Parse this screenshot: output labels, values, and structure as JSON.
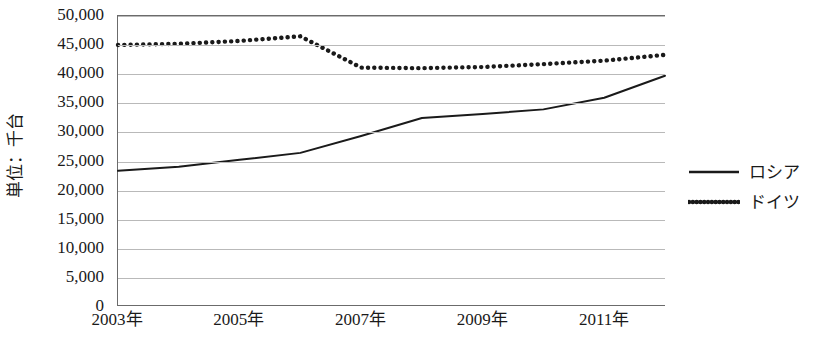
{
  "chart_data": {
    "type": "line",
    "title": "",
    "subtitle": "",
    "xlabel": "",
    "ylabel": "単位：千台",
    "x": [
      2003,
      2004,
      2005,
      2006,
      2007,
      2008,
      2009,
      2010,
      2011,
      2012
    ],
    "x_tick_labels": [
      "2003年",
      "2005年",
      "2007年",
      "2009年",
      "2011年"
    ],
    "x_tick_values": [
      2003,
      2005,
      2007,
      2009,
      2011
    ],
    "xlim": [
      2003,
      2012
    ],
    "ylim": [
      0,
      50000
    ],
    "y_ticks": [
      0,
      5000,
      10000,
      15000,
      20000,
      25000,
      30000,
      35000,
      40000,
      45000,
      50000
    ],
    "y_tick_labels": [
      "0",
      "5,000",
      "10,000",
      "15,000",
      "20,000",
      "25,000",
      "30,000",
      "35,000",
      "40,000",
      "45,000",
      "50,000"
    ],
    "grid": true,
    "grid_axis": "y",
    "legend_position": "right",
    "series": [
      {
        "name": "ロシア",
        "style": "solid",
        "color": "#1a1a1a",
        "values": [
          23300,
          24000,
          25200,
          26400,
          29300,
          32400,
          33100,
          33900,
          35900,
          39700
        ]
      },
      {
        "name": "ドイツ",
        "style": "dotted",
        "color": "#1a1a1a",
        "values": [
          45000,
          45200,
          45700,
          46500,
          41100,
          41000,
          41200,
          41700,
          42300,
          43300
        ]
      }
    ]
  },
  "legend": {
    "items": [
      {
        "label": "ロシア",
        "style": "solid"
      },
      {
        "label": "ドイツ",
        "style": "dotted"
      }
    ]
  }
}
